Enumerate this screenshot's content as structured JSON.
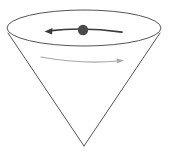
{
  "figure": {
    "background_color": "#ffffff",
    "width": 171,
    "height": 166,
    "elements": {
      "cone_rim_ellipse": {
        "name": "cone-rim-ellipse",
        "cx": 84,
        "cy": 28,
        "rx": 77,
        "ry": 18,
        "stroke_color": "#555555",
        "stroke_width": 1,
        "fill": "none"
      },
      "cone_left_edge": {
        "name": "cone-left-edge",
        "x1": 8,
        "y1": 33,
        "x2": 84,
        "y2": 146,
        "stroke_color": "#555555",
        "stroke_width": 1
      },
      "cone_right_edge": {
        "name": "cone-right-edge",
        "x1": 160,
        "y1": 33,
        "x2": 84,
        "y2": 146,
        "stroke_color": "#555555",
        "stroke_width": 1
      },
      "cone_apex": {
        "name": "cone-apex",
        "x": 84,
        "y": 146
      },
      "particle_dot": {
        "name": "particle-dot",
        "cx": 83,
        "cy": 30,
        "r": 5,
        "fill_color": "#4a4a4a"
      },
      "velocity_arrow": {
        "name": "velocity-arrow-left",
        "direction": "left",
        "path": "M 122 32 Q 84 27 47 31",
        "tip_x": 45,
        "tip_y": 31,
        "stroke_color": "#3a3a3a",
        "stroke_width": 1.8
      },
      "rotation_arrow": {
        "name": "rotation-arrow-right",
        "direction": "right",
        "path": "M 41 57 Q 82 64 119 61",
        "tip_x": 124,
        "tip_y": 61,
        "stroke_color": "#a8a8a8",
        "stroke_width": 1.2
      }
    }
  }
}
